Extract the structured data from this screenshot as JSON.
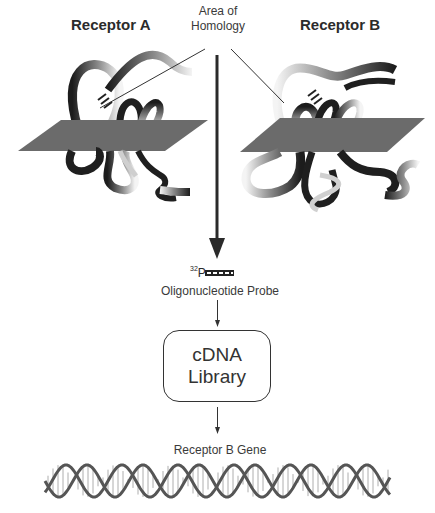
{
  "diagram": {
    "receptor_a": {
      "title": "Receptor A"
    },
    "receptor_b": {
      "title": "Receptor B"
    },
    "homology": {
      "line1": "Area of",
      "line2": "Homology"
    },
    "probe": {
      "isotope_mass": "32",
      "isotope_symbol": "P",
      "label": "Oligonucleotide Probe"
    },
    "library": {
      "line1": "cDNA",
      "line2": "Library"
    },
    "gene": {
      "label": "Receptor B Gene"
    }
  },
  "colors": {
    "plane": "#6b6b6b",
    "ribbon_dark": "#1f1f1f",
    "ribbon_light": "#f2f2f2",
    "arrow": "#2a2a2a",
    "dna_strand": "#555555",
    "dna_rung": "#9a9a9a"
  },
  "flow_steps": [
    "Area of Homology",
    "Oligonucleotide Probe",
    "cDNA Library",
    "Receptor B Gene"
  ]
}
